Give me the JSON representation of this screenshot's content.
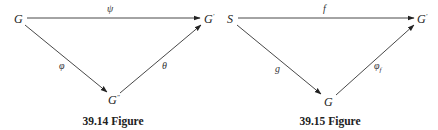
{
  "figures": [
    {
      "caption": "39.14 Figure",
      "nodes": {
        "source": {
          "label": "G",
          "sup": ""
        },
        "target": {
          "label": "G",
          "sup": "′"
        },
        "middle": {
          "label": "G",
          "sup": "″"
        }
      },
      "edges": {
        "top": {
          "label": "ψ",
          "sub": "",
          "from": "G",
          "to": "G′"
        },
        "left": {
          "label": "φ",
          "sub": "",
          "from": "G",
          "to": "G″"
        },
        "right": {
          "label": "θ",
          "sub": "",
          "from": "G″",
          "to": "G′"
        }
      }
    },
    {
      "caption": "39.15 Figure",
      "nodes": {
        "source": {
          "label": "S",
          "sup": ""
        },
        "target": {
          "label": "G",
          "sup": "′"
        },
        "middle": {
          "label": "G",
          "sup": ""
        }
      },
      "edges": {
        "top": {
          "label": "f",
          "sub": "",
          "from": "S",
          "to": "G′"
        },
        "left": {
          "label": "g",
          "sub": "",
          "from": "S",
          "to": "G"
        },
        "right": {
          "label": "φ",
          "sub": "f",
          "from": "G",
          "to": "G′"
        }
      }
    }
  ],
  "colors": {
    "line": "#333333",
    "text": "#222222",
    "background": "#ffffff"
  }
}
